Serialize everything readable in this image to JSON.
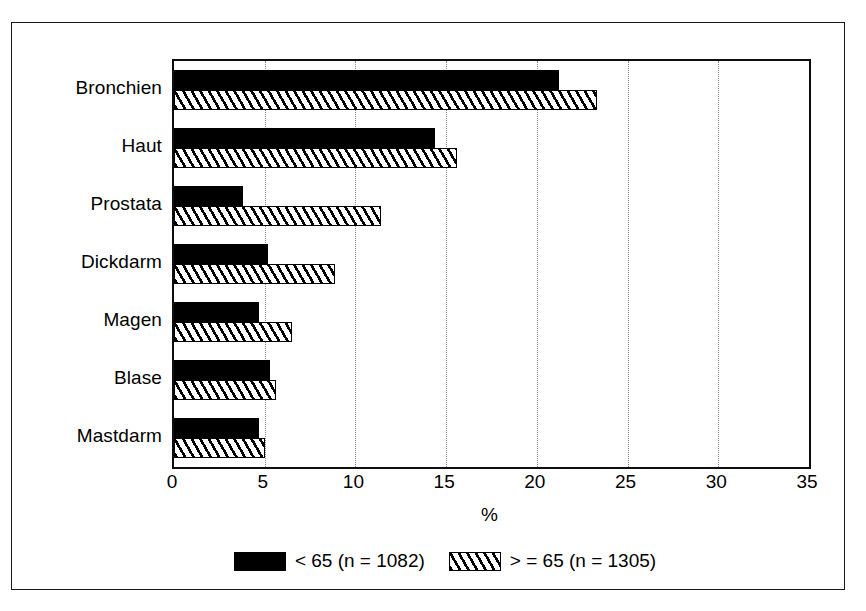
{
  "chart_data": {
    "type": "bar",
    "orientation": "horizontal",
    "title": "",
    "xlabel": "%",
    "ylabel": "",
    "xlim": [
      0,
      35
    ],
    "xticks": [
      0,
      5,
      10,
      15,
      20,
      25,
      30,
      35
    ],
    "xtick_labels": [
      "0",
      "5",
      "10",
      "15",
      "20",
      "25",
      "30",
      "35"
    ],
    "grid": "vertical-dotted",
    "legend_position": "bottom-center",
    "categories": [
      "Bronchien",
      "Haut",
      "Prostata",
      "Dickdarm",
      "Magen",
      "Blase",
      "Mastdarm"
    ],
    "series": [
      {
        "name": "< 65 (n = 1082)",
        "fill": "solid-black",
        "color": "#000000",
        "values": [
          21.2,
          14.4,
          3.8,
          5.2,
          4.7,
          5.3,
          4.7
        ]
      },
      {
        "name": "> = 65 (n = 1305)",
        "fill": "diagonal-hatch",
        "color": "#000000",
        "values": [
          23.3,
          15.6,
          11.4,
          8.9,
          6.5,
          5.6,
          5.0
        ]
      }
    ]
  },
  "legend": {
    "entries": [
      {
        "label": "< 65 (n = 1082)",
        "swatch": "solid-black-swatch"
      },
      {
        "label": "> = 65 (n = 1305)",
        "swatch": "hatched-swatch"
      }
    ]
  }
}
